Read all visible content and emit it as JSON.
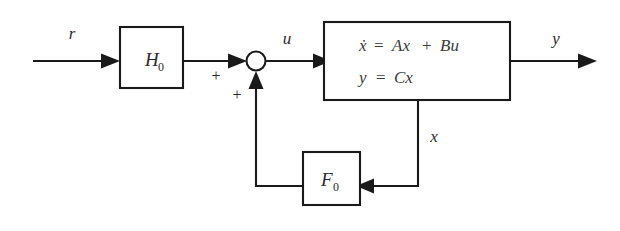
{
  "diagram": {
    "signals": {
      "reference": "r",
      "control": "u",
      "output": "y",
      "state": "x"
    },
    "blocks": {
      "prefilter": {
        "label": "H",
        "subscript": "0"
      },
      "plant": {
        "equation_state": "ẋ = Ax + Bu",
        "equation_state_lhs": "ẋ",
        "equation_state_eq": "=",
        "equation_state_rhs_a": "Ax",
        "equation_state_plus": "+",
        "equation_state_rhs_b": "Bu",
        "equation_output": "y = Cx",
        "equation_output_lhs": "y",
        "equation_output_eq": "=",
        "equation_output_rhs": "Cx"
      },
      "feedback": {
        "label": "F",
        "subscript": "0"
      }
    },
    "summing_junction": {
      "sign_reference": "+",
      "sign_feedback": "+"
    },
    "colors": {
      "line": "#1a1a1a",
      "text": "#2b2b2b",
      "equation_text": "#3a3a3a",
      "background": "#ffffff"
    }
  }
}
